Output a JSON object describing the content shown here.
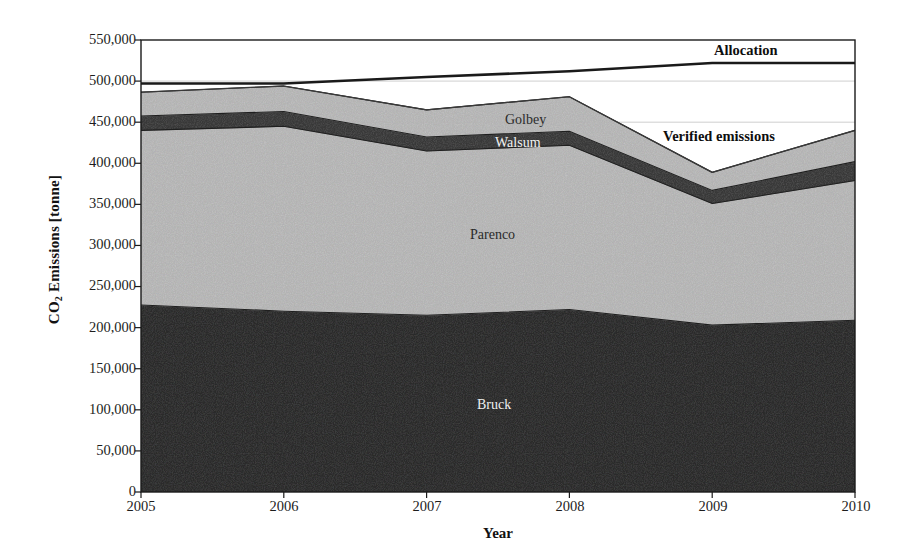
{
  "chart_data": {
    "type": "area",
    "title": "",
    "xlabel": "Year",
    "ylabel": "CO2 Emissions [tonne]",
    "ylabel_display": "CO₂ Emissions [tonne]",
    "x": [
      2005,
      2006,
      2007,
      2008,
      2009,
      2010
    ],
    "xticklabels": [
      "2005",
      "2006",
      "2007",
      "2008",
      "2009",
      "2010"
    ],
    "yticks": [
      0,
      50000,
      100000,
      150000,
      200000,
      250000,
      300000,
      350000,
      400000,
      450000,
      500000,
      550000
    ],
    "yticklabels": [
      "0",
      "50,000",
      "100,000",
      "150,000",
      "200,000",
      "250,000",
      "300,000",
      "350,000",
      "400,000",
      "450,000",
      "500,000",
      "550,000"
    ],
    "ylim": [
      0,
      550000
    ],
    "xlim": [
      2005,
      2010
    ],
    "grid": false,
    "legend_position": "inline-annotations",
    "stacked": true,
    "series": [
      {
        "name": "Bruck",
        "color": "#2b2b2b",
        "values": [
          227500,
          220000,
          215000,
          222000,
          203000,
          209000
        ]
      },
      {
        "name": "Parenco",
        "color": "#b9b9b9",
        "values": [
          212500,
          225000,
          200000,
          200000,
          148000,
          170000
        ]
      },
      {
        "name": "Walsum",
        "color": "#3a3a3a",
        "values": [
          17500,
          18000,
          17000,
          17000,
          16000,
          23000
        ]
      },
      {
        "name": "Golbey",
        "color": "#b9b9b9",
        "values": [
          29000,
          31000,
          33000,
          42000,
          22000,
          38000
        ]
      }
    ],
    "reference_lines": [
      {
        "name": "Allocation",
        "color": "#1a1a1a",
        "values": [
          497000,
          497000,
          505000,
          512000,
          522000,
          522000
        ]
      },
      {
        "name": "Verified emissions",
        "color": "#3a3a3a",
        "values": [
          486500,
          494000,
          465000,
          481000,
          389000,
          440000
        ]
      }
    ],
    "annotations": [
      {
        "text": "Allocation",
        "x_px": 779,
        "y_px": 52,
        "name": "allocation-label"
      },
      {
        "text": "Verified emissions",
        "x_px": 742,
        "y_px": 137,
        "name": "verified-emissions-label"
      },
      {
        "text": "Golbey",
        "x_px": 505,
        "y_px": 120,
        "name": "golbey-label"
      },
      {
        "text": "Walsum",
        "x_px": 495,
        "y_px": 143,
        "name": "walsum-label"
      },
      {
        "text": "Parenco",
        "x_px": 496,
        "y_px": 235,
        "name": "parenco-label"
      },
      {
        "text": "Bruck",
        "x_px": 495,
        "y_px": 405,
        "name": "bruck-label"
      }
    ],
    "colors": {
      "dark_fill": "#2b2b2b",
      "mid_fill": "#b9b9b9",
      "band_fill": "#3a3a3a",
      "axis": "#1a1a1a",
      "gridline": "#cfcfcf",
      "background": "#ffffff"
    }
  }
}
